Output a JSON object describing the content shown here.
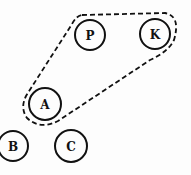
{
  "diagram": {
    "nodes": [
      {
        "id": "P",
        "label": "P",
        "cx": 90,
        "cy": 35,
        "r": 15
      },
      {
        "id": "K",
        "label": "K",
        "cx": 155,
        "cy": 34,
        "r": 15
      },
      {
        "id": "A",
        "label": "A",
        "cx": 45,
        "cy": 104,
        "r": 16
      },
      {
        "id": "B",
        "label": "B",
        "cx": 13,
        "cy": 146,
        "r": 15
      },
      {
        "id": "C",
        "label": "C",
        "cx": 71,
        "cy": 146,
        "r": 16
      }
    ],
    "groups": [
      {
        "id": "group-PKA",
        "members": [
          "P",
          "K",
          "A"
        ],
        "style": "dashed"
      }
    ]
  }
}
